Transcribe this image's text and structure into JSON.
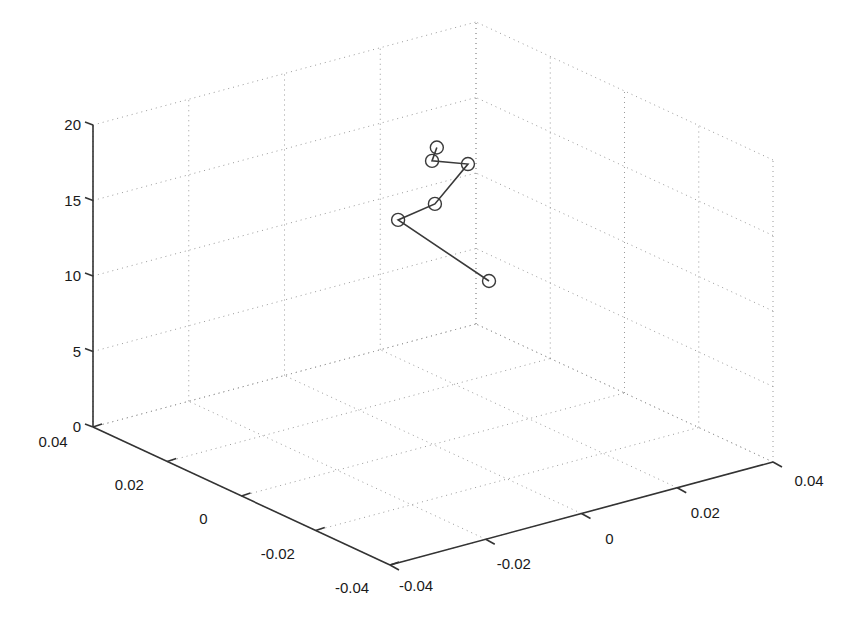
{
  "chart_data": {
    "type": "line3d",
    "title": "",
    "xlabel": "",
    "ylabel": "",
    "zlabel": "",
    "grid": true,
    "legend": null,
    "xlim": [
      -0.04,
      0.04
    ],
    "ylim": [
      -0.04,
      0.04
    ],
    "zlim": [
      0,
      20
    ],
    "xticks": [
      "0.04",
      "0.02",
      "0",
      "-0.02",
      "-0.04"
    ],
    "yticks": [
      "-0.04",
      "-0.02",
      "0",
      "0.02",
      "0.04"
    ],
    "zticks": [
      "0",
      "5",
      "10",
      "15",
      "20"
    ],
    "marker": "circle",
    "series": [
      {
        "name": "trajectory",
        "points": [
          {
            "x": 0.0,
            "y": 0.0008,
            "z": 19.6
          },
          {
            "x": 0.0,
            "y": -0.0002,
            "z": 18.8
          },
          {
            "x": 0.0,
            "y": 0.0073,
            "z": 17.95
          },
          {
            "x": 0.0,
            "y": 0.0004,
            "z": 15.9
          },
          {
            "x": 0.0094,
            "y": 0.0,
            "z": 13.8
          },
          {
            "x": 0.0,
            "y": 0.0117,
            "z": 9.83
          }
        ]
      }
    ]
  },
  "colors": {
    "axis": "#333333",
    "grid": "#9a9a9a",
    "series": "#3a3a3a",
    "background": "#ffffff"
  }
}
